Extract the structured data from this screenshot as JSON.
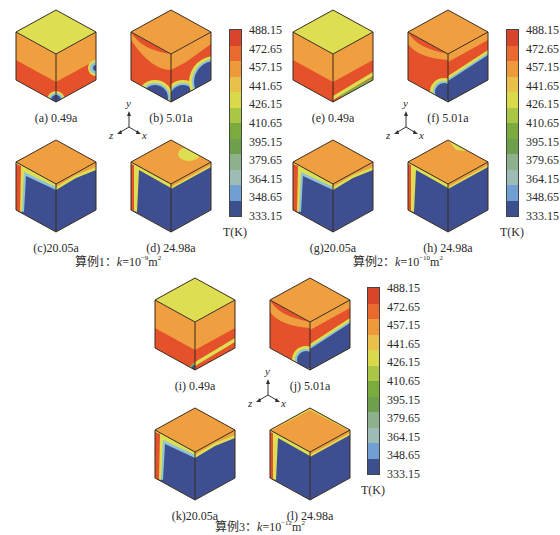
{
  "colorbar": {
    "unit_label": "T(K)",
    "ticks": [
      "488.15",
      "472.65",
      "457.15",
      "441.65",
      "426.15",
      "410.65",
      "395.15",
      "379.65",
      "364.15",
      "348.65",
      "333.15"
    ],
    "colors": [
      "#d8452a",
      "#e9692f",
      "#ee9a3a",
      "#e9c04a",
      "#d9d94a",
      "#a9c744",
      "#7aab3c",
      "#6d9f4c",
      "#8fb08c",
      "#9dbcb6",
      "#6f9fd3",
      "#3c4f8e"
    ]
  },
  "axes": {
    "x": "x",
    "y": "y",
    "z": "z"
  },
  "groups": [
    {
      "title_prefix": "算例1：",
      "k": "k",
      "eq": "=10",
      "exp": "−9",
      "unit": "m",
      "unit_exp": "2",
      "panels": [
        {
          "label": "(a) 0.49a"
        },
        {
          "label": "(b) 5.01a"
        },
        {
          "label": "(c)20.05a"
        },
        {
          "label": "(d) 24.98a"
        }
      ]
    },
    {
      "title_prefix": "算例2：",
      "k": "k",
      "eq": "=10",
      "exp": "−10",
      "unit": "m",
      "unit_exp": "2",
      "panels": [
        {
          "label": "(e) 0.49a"
        },
        {
          "label": "(f) 5.01a"
        },
        {
          "label": "(g)20.05a"
        },
        {
          "label": "(h) 24.98a"
        }
      ]
    },
    {
      "title_prefix": "算例3：",
      "k": "k",
      "eq": "=10",
      "exp": "−12",
      "unit": "m",
      "unit_exp": "2",
      "panels": [
        {
          "label": "(i) 0.49a"
        },
        {
          "label": "(j) 5.01a"
        },
        {
          "label": "(k)20.05a"
        },
        {
          "label": "(l) 24.98a"
        }
      ]
    }
  ],
  "palette": {
    "red": "#e4512b",
    "orange": "#ef9f3f",
    "yellow": "#dede52",
    "green": "#7fb04a",
    "lightblue": "#8fc3d6",
    "blue": "#3e4f91",
    "edge": "#3a2a1a"
  }
}
